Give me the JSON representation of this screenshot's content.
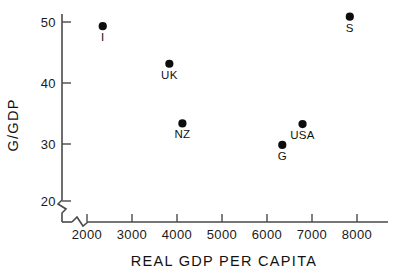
{
  "chart_data": {
    "type": "scatter",
    "title": "",
    "xlabel": "REAL GDP PER CAPITA",
    "ylabel": "G/GDP",
    "xlim": [
      1500,
      8800
    ],
    "ylim": [
      17,
      53
    ],
    "grid": false,
    "legend": "none",
    "axis_break_x": true,
    "axis_break_y": true,
    "xticks": [
      2000,
      3000,
      4000,
      5000,
      6000,
      7000,
      8000
    ],
    "xtick_labels": [
      "2000",
      "3000",
      "4000",
      "5000",
      "6000",
      "7000",
      "8000"
    ],
    "yticks": [
      20,
      30,
      40,
      50
    ],
    "ytick_labels": [
      "20",
      "30",
      "40",
      "50"
    ],
    "points": [
      {
        "label": "I",
        "x": 2350,
        "y": 49.3,
        "label_pos": "below"
      },
      {
        "label": "UK",
        "x": 3830,
        "y": 43.0,
        "label_pos": "below"
      },
      {
        "label": "NZ",
        "x": 4120,
        "y": 33.0,
        "label_pos": "below"
      },
      {
        "label": "G",
        "x": 6340,
        "y": 29.4,
        "label_pos": "below"
      },
      {
        "label": "USA",
        "x": 6790,
        "y": 32.9,
        "label_pos": "below"
      },
      {
        "label": "S",
        "x": 7840,
        "y": 50.9,
        "label_pos": "below"
      }
    ]
  },
  "colors": {
    "marker": "#0d0d0d",
    "axis": "#4a4a4a",
    "text": "#111111",
    "background": "#ffffff"
  }
}
